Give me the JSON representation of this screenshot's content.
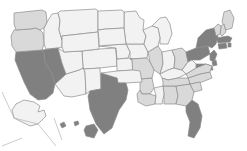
{
  "map": {
    "title": "United States choropleth map",
    "projection": "albers-usa",
    "background_color": "#ffffff",
    "border_color": "#8c8c8c",
    "inset_separator_color": "#b4b4b4",
    "shade_scale": {
      "type": "sequential-gray",
      "bands": [
        {
          "key": "none",
          "color": "#ffffff"
        },
        {
          "key": "low",
          "color": "#f2f2f2"
        },
        {
          "key": "medium",
          "color": "#d9d9d9"
        },
        {
          "key": "high",
          "color": "#bfbfbf"
        },
        {
          "key": "max",
          "color": "#808080"
        }
      ]
    },
    "insets": [
      "AK",
      "HI"
    ]
  },
  "chart_data": {
    "type": "choropleth",
    "xlabel": "",
    "ylabel": "",
    "legend": [],
    "categories": [
      "AK",
      "AL",
      "AR",
      "AZ",
      "CA",
      "CO",
      "CT",
      "DE",
      "FL",
      "GA",
      "HI",
      "IA",
      "ID",
      "IL",
      "IN",
      "KS",
      "KY",
      "LA",
      "MA",
      "MD",
      "ME",
      "MI",
      "MN",
      "MO",
      "MS",
      "MT",
      "NC",
      "ND",
      "NE",
      "NH",
      "NJ",
      "NM",
      "NV",
      "NY",
      "OH",
      "OK",
      "OR",
      "PA",
      "RI",
      "SC",
      "SD",
      "TN",
      "TX",
      "UT",
      "VA",
      "VT",
      "WA",
      "WI",
      "WV",
      "WY"
    ],
    "values": {
      "AK": "low",
      "AL": "medium",
      "AR": "medium",
      "AZ": "low",
      "CA": "max",
      "CO": "low",
      "CT": "max",
      "DE": "max",
      "FL": "max",
      "GA": "medium",
      "HI": "max",
      "IA": "low",
      "ID": "low",
      "IL": "medium",
      "IN": "low",
      "KS": "low",
      "KY": "low",
      "LA": "medium",
      "MA": "max",
      "MD": "max",
      "ME": "medium",
      "MI": "low",
      "MN": "low",
      "MO": "medium",
      "MS": "low",
      "MT": "low",
      "NC": "medium",
      "ND": "low",
      "NE": "low",
      "NH": "medium",
      "NJ": "max",
      "NM": "low",
      "NV": "max",
      "NY": "max",
      "OH": "medium",
      "OK": "low",
      "OR": "medium",
      "PA": "max",
      "RI": "max",
      "SC": "medium",
      "SD": "low",
      "TN": "medium",
      "TX": "max",
      "UT": "low",
      "VA": "medium",
      "VT": "medium",
      "WA": "medium",
      "WI": "low",
      "WV": "low",
      "WY": "low"
    },
    "value_colors": {
      "none": "#ffffff",
      "low": "#f2f2f2",
      "medium": "#d9d9d9",
      "high": "#bfbfbf",
      "max": "#808080"
    },
    "state_names": {
      "AK": "Alaska",
      "AL": "Alabama",
      "AR": "Arkansas",
      "AZ": "Arizona",
      "CA": "California",
      "CO": "Colorado",
      "CT": "Connecticut",
      "DE": "Delaware",
      "FL": "Florida",
      "GA": "Georgia",
      "HI": "Hawaii",
      "IA": "Iowa",
      "ID": "Idaho",
      "IL": "Illinois",
      "IN": "Indiana",
      "KS": "Kansas",
      "KY": "Kentucky",
      "LA": "Louisiana",
      "MA": "Massachusetts",
      "MD": "Maryland",
      "ME": "Maine",
      "MI": "Michigan",
      "MN": "Minnesota",
      "MO": "Missouri",
      "MS": "Mississippi",
      "MT": "Montana",
      "NC": "North Carolina",
      "ND": "North Dakota",
      "NE": "Nebraska",
      "NH": "New Hampshire",
      "NJ": "New Jersey",
      "NM": "New Mexico",
      "NV": "Nevada",
      "NY": "New York",
      "OH": "Ohio",
      "OK": "Oklahoma",
      "OR": "Oregon",
      "PA": "Pennsylvania",
      "RI": "Rhode Island",
      "SC": "South Carolina",
      "SD": "South Dakota",
      "TN": "Tennessee",
      "TX": "Texas",
      "UT": "Utah",
      "VA": "Virginia",
      "VT": "Vermont",
      "WA": "Washington",
      "WI": "Wisconsin",
      "WV": "West Virginia",
      "WY": "Wyoming"
    }
  },
  "shapes": {
    "WA": "M14,13 L42,10 L46,12 L47,22 L44,28 L40,30 L36,28 L30,29 L16,30 L14,24 Z",
    "OR": "M14,30 L30,29 L36,28 L40,30 L43,33 L44,44 L42,50 L16,52 L12,46 L11,36 Z",
    "CA": "M16,52 L42,50 L44,53 L45,62 L52,74 L55,84 L53,93 L46,99 L38,100 L30,94 L24,82 L19,70 L15,60 Z",
    "NV": "M42,50 L58,48 L62,63 L66,74 L55,84 L52,74 L45,62 L44,53 Z",
    "ID": "M44,28 L47,22 L52,14 L58,13 L60,20 L59,30 L62,40 L62,47 L58,48 L46,49 L44,44 Z",
    "MT": "M58,13 L60,11 L96,9 L98,11 L98,32 L80,34 L62,36 L62,40 L59,30 L60,20 Z",
    "WY": "M62,36 L80,34 L98,32 L99,49 L82,51 L64,52 L62,47 Z",
    "UT": "M58,48 L64,52 L82,51 L83,68 L79,70 L66,74 L62,63 Z",
    "AZ": "M66,74 L79,70 L83,68 L85,72 L86,94 L72,97 L64,96 L58,88 L55,84 Z",
    "CO": "M82,51 L99,49 L116,48 L117,66 L100,68 L84,69 L83,68 Z",
    "NM": "M83,68 L84,69 L100,68 L101,89 L90,91 L86,94 L85,72 Z",
    "ND": "M98,11 L122,10 L124,12 L124,28 L106,29 L98,30 Z",
    "SD": "M98,30 L106,29 L124,28 L126,44 L110,45 L99,46 L99,40 Z",
    "NE": "M99,46 L110,45 L126,44 L130,52 L128,58 L117,59 L116,48 Z",
    "KS": "M116,48 L117,59 L128,58 L132,59 L133,70 L117,71 L117,66 Z",
    "OK": "M117,71 L133,70 L140,71 L142,82 L126,83 L118,83 L117,78 L102,79 L101,73 Z",
    "TX": "M101,73 L117,78 L118,83 L126,83 L128,90 L126,100 L119,110 L112,128 L104,134 L96,124 L90,110 L88,96 L90,91 L101,89 Z",
    "MN": "M124,12 L136,11 L140,18 L144,20 L143,30 L146,36 L144,44 L126,44 L124,28 Z",
    "IA": "M126,44 L144,44 L148,52 L147,58 L130,59 L130,52 Z",
    "MO": "M130,59 L147,58 L150,62 L154,70 L152,78 L140,79 L133,78 L132,59 Z",
    "AR": "M140,79 L152,78 L154,88 L150,94 L142,94 L140,90 Z",
    "LA": "M140,90 L142,94 L150,94 L156,96 L155,104 L146,106 L138,102 L137,94 Z",
    "WI": "M143,30 L152,26 L158,28 L160,38 L158,46 L148,52 L144,44 L146,36 Z",
    "IL": "M148,52 L158,46 L162,52 L163,64 L160,74 L154,70 L150,62 Z",
    "MS": "M154,88 L156,96 L155,104 L162,104 L164,94 L163,86 Z",
    "MI": "M152,26 L160,18 L166,17 L170,24 L172,34 L168,44 L160,44 L160,38 L158,28 Z",
    "IN": "M163,64 L162,52 L172,50 L175,58 L174,68 L168,70 L160,74 Z",
    "OH": "M172,50 L182,48 L186,52 L188,62 L182,70 L174,68 L175,58 Z",
    "KY": "M160,74 L168,70 L174,68 L182,70 L186,74 L178,78 L168,80 L162,78 Z",
    "TN": "M162,78 L168,80 L178,78 L188,78 L190,84 L176,86 L163,86 L163,82 Z",
    "AL": "M163,86 L176,86 L178,96 L176,104 L164,104 L164,94 Z",
    "GA": "M176,86 L190,84 L194,92 L192,100 L186,106 L176,104 L178,96 Z",
    "FL": "M186,106 L192,100 L198,104 L202,116 L200,128 L194,138 L188,136 L190,122 L186,112 Z",
    "SC": "M190,84 L200,82 L202,90 L194,92 Z",
    "NC": "M188,78 L200,74 L210,72 L212,78 L202,82 L190,84 Z",
    "VA": "M186,74 L196,68 L206,64 L212,66 L210,72 L200,74 L188,78 Z",
    "WV": "M182,70 L188,62 L192,60 L196,64 L196,68 L186,74 Z",
    "PA": "M188,62 L186,52 L196,48 L208,46 L210,54 L200,60 L192,60 Z",
    "NY": "M196,48 L198,38 L206,30 L214,28 L218,36 L216,44 L212,48 L208,46 Z",
    "ME": "M224,12 L230,10 L234,18 L232,28 L226,30 L222,22 Z",
    "VT": "M214,28 L218,24 L221,26 L220,34 L216,36 Z",
    "NH": "M221,26 L224,24 L226,32 L222,36 L220,34 Z",
    "MA": "M216,38 L228,36 L232,38 L230,42 L218,43 Z",
    "CT": "M218,44 L226,43 L227,48 L219,49 Z",
    "RI": "M228,43 L231,43 L231,47 L228,47 Z",
    "NJ": "M210,54 L214,50 L217,54 L214,62 L210,60 Z",
    "DE": "M212,62 L216,60 L217,65 L213,66 Z",
    "MD": "M196,64 L206,64 L212,66 L213,70 L204,70 L196,68 Z",
    "AK": "M16,104 L24,100 L34,102 L40,106 L38,112 L44,110 L46,116 L38,124 L30,126 L22,122 L14,118 L12,110 Z",
    "HI": "M60,124 L64,122 L66,126 L62,128 Z;M74,122 L78,121 L79,124 L75,126 Z;M86,126 L94,124 L98,130 L94,138 L86,136 L84,130 Z",
    "AK_sep": "M2,92 L14,118 L38,124 L56,146 M2,146 L22,138",
    "HI_sep": "M54,118 L62,140"
  }
}
